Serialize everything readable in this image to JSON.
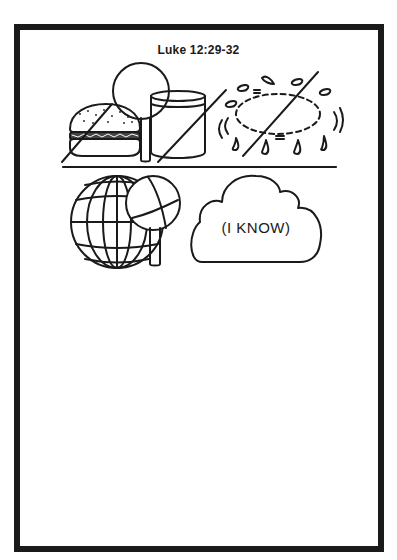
{
  "worksheet": {
    "title": "Luke 12:29-32",
    "border_color": "#1a1a1a",
    "background": "#ffffff",
    "top_row": {
      "panels": [
        {
          "name": "food-and-drink-crossed-out",
          "items": [
            "hamburger",
            "tree",
            "cup"
          ],
          "crossed_out": true
        },
        {
          "name": "worry-crossed-out",
          "items": [
            "sweat-drops",
            "dashed-oval"
          ],
          "crossed_out": true
        }
      ]
    },
    "bottom_row": {
      "panels": [
        {
          "name": "world-and-tree",
          "items": [
            "globe",
            "tree"
          ]
        },
        {
          "name": "thought-cloud",
          "text": "(I KNOW)"
        }
      ]
    }
  }
}
